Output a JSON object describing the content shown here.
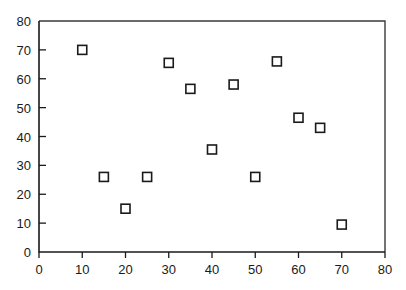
{
  "chart_data": {
    "type": "scatter",
    "title": "",
    "subtitle": "",
    "xlabel": "",
    "ylabel": "",
    "xlim": [
      0,
      80
    ],
    "ylim": [
      0,
      80
    ],
    "xticks": [
      0,
      10,
      20,
      30,
      40,
      50,
      60,
      70,
      80
    ],
    "yticks": [
      0,
      10,
      20,
      30,
      40,
      50,
      60,
      70,
      80
    ],
    "xtick_labels": [
      "0",
      "10",
      "20",
      "30",
      "40",
      "50",
      "60",
      "70",
      "80"
    ],
    "ytick_labels": [
      "0",
      "10",
      "20",
      "30",
      "40",
      "50",
      "60",
      "70",
      "80"
    ],
    "grid": false,
    "legend": null,
    "marker": "open-square",
    "marker_fill": "#ffffff",
    "marker_edge_color": "#1a1a1a",
    "axis_color": "#1a1a1a",
    "frame_color": "#3a3a3a",
    "background_color": "#ffffff",
    "series": [
      {
        "name": "",
        "x": [
          10,
          15,
          20,
          25,
          30,
          35,
          40,
          45,
          50,
          55,
          60,
          65,
          70
        ],
        "y": [
          70,
          26,
          15,
          26,
          65.5,
          56.5,
          35.5,
          58,
          26,
          66,
          46.5,
          43,
          9.5
        ],
        "points": [
          {
            "x": 10,
            "y": 70
          },
          {
            "x": 15,
            "y": 26
          },
          {
            "x": 20,
            "y": 15
          },
          {
            "x": 25,
            "y": 26
          },
          {
            "x": 30,
            "y": 65.5
          },
          {
            "x": 35,
            "y": 56.5
          },
          {
            "x": 40,
            "y": 35.5
          },
          {
            "x": 45,
            "y": 58
          },
          {
            "x": 50,
            "y": 26
          },
          {
            "x": 55,
            "y": 66
          },
          {
            "x": 60,
            "y": 46.5
          },
          {
            "x": 65,
            "y": 43
          },
          {
            "x": 70,
            "y": 9.5
          }
        ]
      }
    ]
  }
}
